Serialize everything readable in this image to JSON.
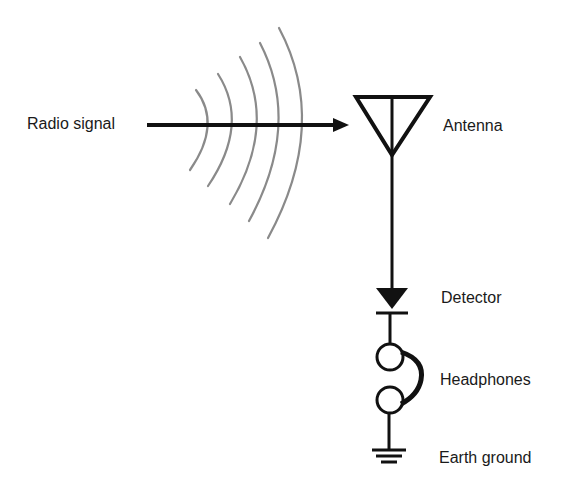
{
  "diagram": {
    "type": "crystal-radio-schematic",
    "labels": {
      "radio_signal": "Radio signal",
      "antenna": "Antenna",
      "detector": "Detector",
      "headphones": "Headphones",
      "earth_ground": "Earth ground"
    },
    "components": [
      {
        "id": "radio-signal",
        "symbol": "arrow-with-waves",
        "label": "Radio signal"
      },
      {
        "id": "antenna",
        "symbol": "antenna-triangle",
        "label": "Antenna"
      },
      {
        "id": "detector",
        "symbol": "diode",
        "label": "Detector"
      },
      {
        "id": "headphones",
        "symbol": "headphones-two-circles",
        "label": "Headphones"
      },
      {
        "id": "earth-ground",
        "symbol": "ground",
        "label": "Earth ground"
      }
    ],
    "connections": [
      [
        "radio-signal",
        "antenna"
      ],
      [
        "antenna",
        "detector"
      ],
      [
        "detector",
        "headphones"
      ],
      [
        "headphones",
        "earth-ground"
      ]
    ],
    "colors": {
      "line": "#111111",
      "waves": "#8a8a8a",
      "background": "#ffffff"
    }
  }
}
